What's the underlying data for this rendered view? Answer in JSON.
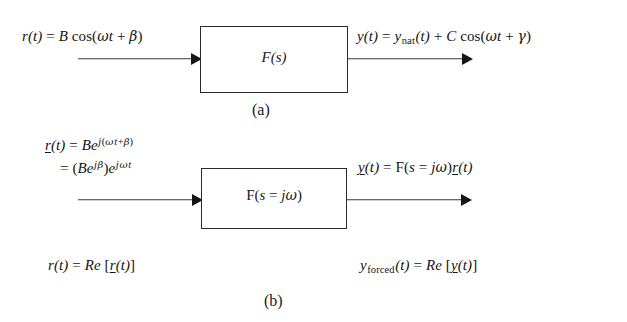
{
  "figure": {
    "background_color": "#ffffff",
    "line_color": "#2a2a2a",
    "text_color": "#141414"
  },
  "panel_a": {
    "caption": "(a)",
    "block_label": "F(s)",
    "input_equation": {
      "lhs": "r(t)",
      "eq": "=",
      "amplitude": "B",
      "function": "cos(",
      "omega": "ω",
      "time": "t",
      "plus": "+",
      "phase": "β",
      "close": ")",
      "plain_text": "r(t) = B cos(ωt + β)"
    },
    "output_equation": {
      "lhs": "y(t)",
      "eq": "=",
      "nat_base": "y",
      "nat_sub": "nat",
      "nat_arg": "(t)",
      "plus": "+",
      "amplitude": "C",
      "function": "cos(",
      "omega": "ω",
      "time": "t",
      "plus2": "+",
      "phase": "γ",
      "close": ")",
      "plain_text": "y(t) = y_nat(t) + C cos(ωt + γ)"
    }
  },
  "panel_b": {
    "caption": "(b)",
    "block_label": {
      "f": "F(",
      "s": "s",
      "eq": "=",
      "j": "j",
      "omega": "ω",
      "close": ")",
      "plain_text": "F(s = jω)"
    },
    "input_equation_line1": {
      "lhs_underlined": "r",
      "lhs_arg": "(t)",
      "eq": "=",
      "amplitude": "B",
      "e": "e",
      "exp_j": "j",
      "exp_open": "(",
      "exp_omega": "ω",
      "exp_t": "t",
      "exp_plus": "+",
      "exp_beta": "β",
      "exp_close": ")",
      "plain_text": "r(t) = Be^{j(ωt + β)}"
    },
    "input_equation_line2": {
      "eq": "=",
      "open": "(",
      "amplitude": "B",
      "e": "e",
      "exp_j": "j",
      "exp_beta": "β",
      "close": ")",
      "e2": "e",
      "exp2_j": "j",
      "exp2_omega": "ω",
      "exp2_t": "t",
      "plain_text": "= (Be^{jβ})e^{jωt}"
    },
    "output_equation": {
      "lhs_underlined": "y",
      "lhs_arg": "(t)",
      "eq": "=",
      "f": "F(",
      "s": "s",
      "eq2": "=",
      "j": "j",
      "omega": "ω",
      "close": ")",
      "r_underlined": "r",
      "r_arg": "(t)",
      "plain_text": "y(t) = F(s = jω)r(t)"
    },
    "bottom_left_equation": {
      "lhs": "r(t)",
      "eq": "=",
      "re": "Re",
      "bracket_open": "[",
      "inner_underlined": "r",
      "inner_arg": "(t)",
      "bracket_close": "]",
      "plain_text": "r(t) = Re[r(t)]"
    },
    "bottom_right_equation": {
      "lhs_base": "y",
      "lhs_sub": "forced",
      "lhs_arg": "(t)",
      "eq": "=",
      "re": "Re",
      "bracket_open": "[",
      "inner_underlined": "y",
      "inner_arg": "(t)",
      "bracket_close": "]",
      "plain_text": "y_forced(t) = Re[y(t)]"
    }
  }
}
